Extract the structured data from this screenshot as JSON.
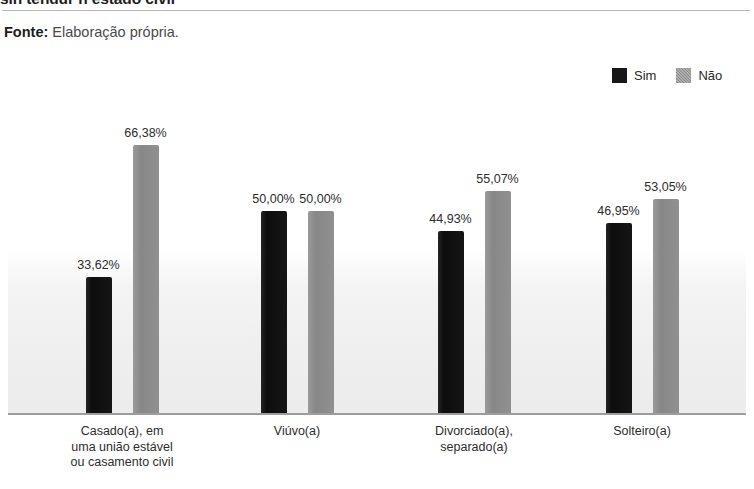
{
  "header": {
    "title": "sin tendur n estado civil",
    "fonte_label": "Fonte:",
    "fonte_value": "Elaboração própria."
  },
  "legend": {
    "items": [
      {
        "label": "Sim",
        "swatch": "black-square-icon",
        "color": "#141414"
      },
      {
        "label": "Não",
        "swatch": "gray-hatched-square-icon",
        "color": "#8e8e8e"
      }
    ]
  },
  "chart_data": {
    "type": "bar",
    "title": "sin tendur n estado civil",
    "xlabel": "",
    "ylabel": "",
    "ylim": [
      0,
      75
    ],
    "grid": false,
    "legend_position": "top-right",
    "categories": [
      "Casado(a), em\numa união estável\nou casamento civil",
      "Viúvo(a)",
      "Divorciado(a),\nseparado(a)",
      "Solteiro(a)"
    ],
    "series": [
      {
        "name": "Sim",
        "color": "#141414",
        "values": [
          33.62,
          50.0,
          44.93,
          46.95
        ],
        "labels": [
          "33,62%",
          "50,00%",
          "44,93%",
          "46,95%"
        ]
      },
      {
        "name": "Não",
        "color": "#8e8e8e",
        "values": [
          66.38,
          50.0,
          55.07,
          53.05
        ],
        "labels": [
          "66,38%",
          "50,00%",
          "55,07%",
          "53,05%"
        ]
      }
    ],
    "source": "Elaboração própria."
  }
}
